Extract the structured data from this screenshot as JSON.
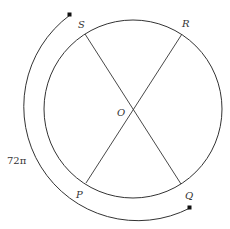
{
  "diagram": {
    "center_label": "O",
    "points": {
      "S": "S",
      "R": "R",
      "P": "P",
      "Q": "Q"
    },
    "arc_label": "72π",
    "colors": {
      "stroke": "#333333",
      "background": "#ffffff"
    }
  }
}
